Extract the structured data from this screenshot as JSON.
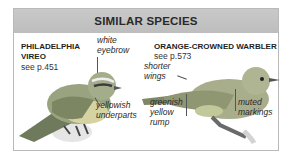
{
  "title": "SIMILAR SPECIES",
  "species": [
    {
      "name_line1": "PHILADELPHIA",
      "name_line2": "VIREO",
      "page_ref": "see p.451",
      "labels": {
        "eyebrow_1": "white",
        "eyebrow_2": "eyebrow",
        "underparts_1": "yellowish",
        "underparts_2": "underparts"
      }
    },
    {
      "name": "ORANGE-CROWNED WARBLER",
      "page_ref": "see p.573",
      "labels": {
        "wings_1": "shorter",
        "wings_2": "wings",
        "rump_1": "greenish",
        "rump_2": "yellow",
        "rump_3": "rump",
        "markings_1": "muted",
        "markings_2": "markings"
      }
    }
  ],
  "colors": {
    "header_bg": "#c4c4c4",
    "border": "#b9b9b9",
    "text": "#2a2a2a"
  }
}
